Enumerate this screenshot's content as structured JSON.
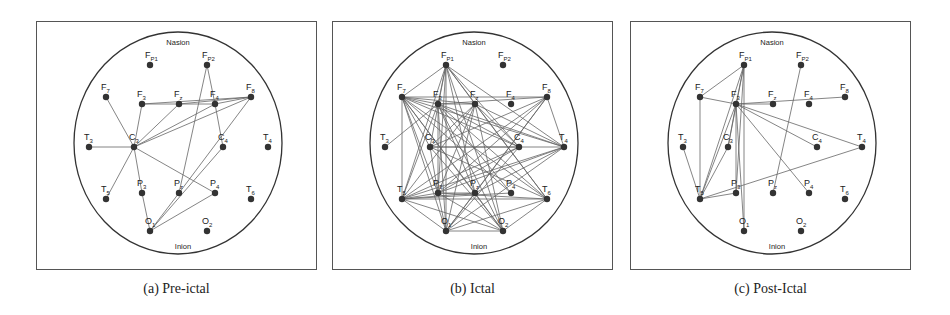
{
  "figure": {
    "landmarks": {
      "top": "Nasion",
      "bottom": "Inion"
    },
    "electrodes": [
      {
        "id": "FP1",
        "main": "F",
        "sub": "P1",
        "x": 113,
        "y": 43
      },
      {
        "id": "FP2",
        "main": "F",
        "sub": "P2",
        "x": 170,
        "y": 43
      },
      {
        "id": "F7",
        "main": "F",
        "sub": "7",
        "x": 69,
        "y": 75
      },
      {
        "id": "F3",
        "main": "F",
        "sub": "3",
        "x": 105,
        "y": 82
      },
      {
        "id": "Fz",
        "main": "F",
        "sub": "z",
        "x": 142,
        "y": 82
      },
      {
        "id": "F4",
        "main": "F",
        "sub": "4",
        "x": 178,
        "y": 82
      },
      {
        "id": "F8",
        "main": "F",
        "sub": "8",
        "x": 214,
        "y": 75
      },
      {
        "id": "T3",
        "main": "T",
        "sub": "3",
        "x": 52,
        "y": 125
      },
      {
        "id": "C3",
        "main": "C",
        "sub": "3",
        "x": 97,
        "y": 125
      },
      {
        "id": "C4",
        "main": "C",
        "sub": "4",
        "x": 186,
        "y": 125
      },
      {
        "id": "T4",
        "main": "T",
        "sub": "4",
        "x": 231,
        "y": 125
      },
      {
        "id": "T5",
        "main": "T",
        "sub": "5",
        "x": 69,
        "y": 177
      },
      {
        "id": "P3",
        "main": "P",
        "sub": "3",
        "x": 105,
        "y": 171
      },
      {
        "id": "Pz",
        "main": "P",
        "sub": "z",
        "x": 142,
        "y": 171
      },
      {
        "id": "P4",
        "main": "P",
        "sub": "4",
        "x": 178,
        "y": 171
      },
      {
        "id": "T6",
        "main": "T",
        "sub": "6",
        "x": 214,
        "y": 177
      },
      {
        "id": "O1",
        "main": "O",
        "sub": "1",
        "x": 113,
        "y": 209
      },
      {
        "id": "O2",
        "main": "O",
        "sub": "2",
        "x": 170,
        "y": 209
      }
    ],
    "head": {
      "cx": 141,
      "cy": 121,
      "rx": 104,
      "ry": 111
    },
    "panels": [
      {
        "id": "pre-ictal",
        "caption": "(a) Pre-ictal",
        "left": 36,
        "edges": [
          [
            "F7",
            "C3"
          ],
          [
            "T3",
            "C3"
          ],
          [
            "C3",
            "T5"
          ],
          [
            "C3",
            "F3"
          ],
          [
            "C3",
            "Fz"
          ],
          [
            "C3",
            "F8"
          ],
          [
            "C3",
            "F4"
          ],
          [
            "C3",
            "P3"
          ],
          [
            "C3",
            "P4"
          ],
          [
            "P3",
            "O1"
          ],
          [
            "F3",
            "F8"
          ],
          [
            "F3",
            "F4"
          ],
          [
            "Fz",
            "F8"
          ],
          [
            "F4",
            "C4"
          ],
          [
            "FP2",
            "F4"
          ],
          [
            "FP2",
            "Pz"
          ],
          [
            "F8",
            "Pz"
          ],
          [
            "C4",
            "O1"
          ],
          [
            "Pz",
            "O1"
          ],
          [
            "P4",
            "O1"
          ],
          [
            "F8",
            "F4"
          ]
        ]
      },
      {
        "id": "ictal",
        "caption": "(b) Ictal",
        "left": 332,
        "edges": [
          [
            "FP1",
            "F7"
          ],
          [
            "FP1",
            "F3"
          ],
          [
            "FP1",
            "Fz"
          ],
          [
            "FP1",
            "C3"
          ],
          [
            "FP1",
            "T5"
          ],
          [
            "FP1",
            "P3"
          ],
          [
            "FP1",
            "Pz"
          ],
          [
            "FP1",
            "O1"
          ],
          [
            "FP1",
            "O2"
          ],
          [
            "FP1",
            "T4"
          ],
          [
            "FP1",
            "T6"
          ],
          [
            "FP1",
            "C4"
          ],
          [
            "F7",
            "F3"
          ],
          [
            "F7",
            "Fz"
          ],
          [
            "F7",
            "F8"
          ],
          [
            "F7",
            "C3"
          ],
          [
            "F7",
            "C4"
          ],
          [
            "F7",
            "T4"
          ],
          [
            "F7",
            "T5"
          ],
          [
            "F7",
            "P3"
          ],
          [
            "F7",
            "Pz"
          ],
          [
            "F7",
            "P4"
          ],
          [
            "F7",
            "T6"
          ],
          [
            "F7",
            "O1"
          ],
          [
            "F7",
            "O2"
          ],
          [
            "F3",
            "Fz"
          ],
          [
            "F3",
            "F8"
          ],
          [
            "F3",
            "C4"
          ],
          [
            "F3",
            "T4"
          ],
          [
            "F3",
            "T5"
          ],
          [
            "F3",
            "P3"
          ],
          [
            "F3",
            "Pz"
          ],
          [
            "F3",
            "T6"
          ],
          [
            "F3",
            "O1"
          ],
          [
            "F3",
            "O2"
          ],
          [
            "F3",
            "P4"
          ],
          [
            "Fz",
            "C3"
          ],
          [
            "Fz",
            "T5"
          ],
          [
            "Fz",
            "P3"
          ],
          [
            "Fz",
            "O1"
          ],
          [
            "Fz",
            "O2"
          ],
          [
            "Fz",
            "T6"
          ],
          [
            "Fz",
            "T4"
          ],
          [
            "Fz",
            "C4"
          ],
          [
            "F8",
            "C3"
          ],
          [
            "F8",
            "T4"
          ],
          [
            "F8",
            "T5"
          ],
          [
            "F8",
            "P3"
          ],
          [
            "F8",
            "Pz"
          ],
          [
            "F8",
            "O1"
          ],
          [
            "T3",
            "F3"
          ],
          [
            "C3",
            "C4"
          ],
          [
            "C3",
            "T4"
          ],
          [
            "C3",
            "P3"
          ],
          [
            "C3",
            "O2"
          ],
          [
            "C3",
            "T6"
          ],
          [
            "C4",
            "T5"
          ],
          [
            "C4",
            "P3"
          ],
          [
            "C4",
            "O1"
          ],
          [
            "T4",
            "T5"
          ],
          [
            "T4",
            "P3"
          ],
          [
            "T4",
            "Pz"
          ],
          [
            "T4",
            "O1"
          ],
          [
            "T5",
            "P3"
          ],
          [
            "T5",
            "Pz"
          ],
          [
            "T5",
            "T6"
          ],
          [
            "T5",
            "O1"
          ],
          [
            "T5",
            "O2"
          ],
          [
            "T5",
            "P4"
          ],
          [
            "P3",
            "T6"
          ],
          [
            "P3",
            "Pz"
          ],
          [
            "P3",
            "O2"
          ],
          [
            "P3",
            "O1"
          ],
          [
            "Pz",
            "O1"
          ],
          [
            "Pz",
            "O2"
          ],
          [
            "T6",
            "O1"
          ],
          [
            "T6",
            "O2"
          ],
          [
            "O1",
            "O2"
          ]
        ]
      },
      {
        "id": "post-ictal",
        "caption": "(c) Post-Ictal",
        "left": 630,
        "edges": [
          [
            "FP1",
            "F7"
          ],
          [
            "FP1",
            "F3"
          ],
          [
            "FP1",
            "T5"
          ],
          [
            "FP1",
            "O1"
          ],
          [
            "FP1",
            "P3"
          ],
          [
            "FP1",
            "C3"
          ],
          [
            "F7",
            "F3"
          ],
          [
            "F7",
            "T5"
          ],
          [
            "F3",
            "Fz"
          ],
          [
            "F3",
            "F8"
          ],
          [
            "F3",
            "C4"
          ],
          [
            "F3",
            "T4"
          ],
          [
            "F3",
            "P4"
          ],
          [
            "F3",
            "T5"
          ],
          [
            "F3",
            "P3"
          ],
          [
            "F3",
            "O1"
          ],
          [
            "F3",
            "C3"
          ],
          [
            "T3",
            "T5"
          ],
          [
            "C3",
            "T5"
          ],
          [
            "T5",
            "P3"
          ],
          [
            "T5",
            "T4"
          ],
          [
            "FP2",
            "Pz"
          ]
        ]
      }
    ]
  }
}
